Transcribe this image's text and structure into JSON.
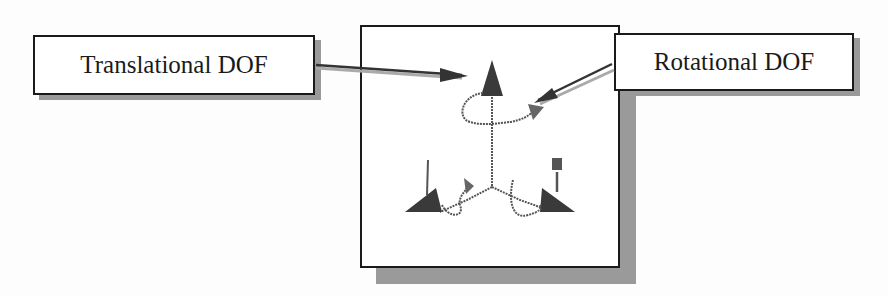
{
  "labels": {
    "translational": "Translational DOF",
    "rotational": "Rotational DOF"
  },
  "colors": {
    "ink": "#1a1a1a",
    "shadow": "#9a9a9a",
    "arrow_body": "#333333",
    "arrow_shadow": "#aaaaaa",
    "cone_fill": "#3a3a3a",
    "rot_arrow_fill": "#666666"
  },
  "figure": {
    "translational_arrows": 3,
    "rotational_arrows": 3
  }
}
